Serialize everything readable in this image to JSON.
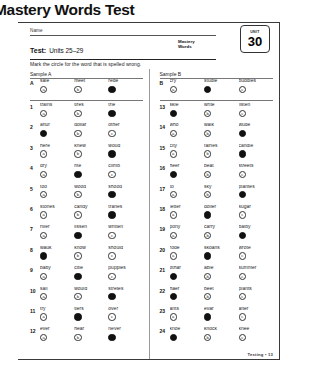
{
  "page_title": "Mastery Words Test",
  "header": {
    "name_label": "Name",
    "test_label": "Test:",
    "test_units": "Units 25–29",
    "mastery_line1": "Mastery",
    "mastery_line2": "Words",
    "unit_word": "UNIT",
    "unit_number": "30"
  },
  "instructions": "Mark the circle for the word that is spelled wrong.",
  "footer": "Testing • 13",
  "left_column": {
    "sample_label": "Sample A",
    "sample": {
      "num": "A",
      "choices": [
        {
          "word": "sale",
          "letter": "a",
          "filled": false
        },
        {
          "word": "meet",
          "letter": "b",
          "filled": false
        },
        {
          "word": "rede",
          "letter": "c",
          "filled": true
        }
      ]
    },
    "items": [
      {
        "num": "1",
        "choices": [
          {
            "word": "trains",
            "letter": "a",
            "filled": false
          },
          {
            "word": "tires",
            "letter": "b",
            "filled": false
          },
          {
            "word": "trie",
            "letter": "c",
            "filled": true
          }
        ]
      },
      {
        "num": "2",
        "choices": [
          {
            "word": "aftur",
            "letter": "a",
            "filled": true
          },
          {
            "word": "dollar",
            "letter": "b",
            "filled": false
          },
          {
            "word": "other",
            "letter": "c",
            "filled": false
          }
        ]
      },
      {
        "num": "3",
        "choices": [
          {
            "word": "here",
            "letter": "a",
            "filled": false
          },
          {
            "word": "knew",
            "letter": "b",
            "filled": false
          },
          {
            "word": "woud",
            "letter": "c",
            "filled": true
          }
        ]
      },
      {
        "num": "4",
        "choices": [
          {
            "word": "dry",
            "letter": "a",
            "filled": false
          },
          {
            "word": "rite",
            "letter": "b",
            "filled": true
          },
          {
            "word": "climb",
            "letter": "c",
            "filled": false
          }
        ]
      },
      {
        "num": "5",
        "choices": [
          {
            "word": "too",
            "letter": "a",
            "filled": false
          },
          {
            "word": "wood",
            "letter": "b",
            "filled": false
          },
          {
            "word": "shood",
            "letter": "c",
            "filled": true
          }
        ]
      },
      {
        "num": "6",
        "choices": [
          {
            "word": "stones",
            "letter": "a",
            "filled": false
          },
          {
            "word": "candy",
            "letter": "b",
            "filled": false
          },
          {
            "word": "tranes",
            "letter": "c",
            "filled": true
          }
        ]
      },
      {
        "num": "7",
        "choices": [
          {
            "word": "river",
            "letter": "a",
            "filled": false
          },
          {
            "word": "lissen",
            "letter": "b",
            "filled": true
          },
          {
            "word": "written",
            "letter": "c",
            "filled": false
          }
        ]
      },
      {
        "num": "8",
        "choices": [
          {
            "word": "wauk",
            "letter": "a",
            "filled": true
          },
          {
            "word": "know",
            "letter": "b",
            "filled": false
          },
          {
            "word": "should",
            "letter": "c",
            "filled": false
          }
        ]
      },
      {
        "num": "9",
        "choices": [
          {
            "word": "baby",
            "letter": "a",
            "filled": false
          },
          {
            "word": "citie",
            "letter": "b",
            "filled": true
          },
          {
            "word": "puppies",
            "letter": "c",
            "filled": false
          }
        ]
      },
      {
        "num": "10",
        "choices": [
          {
            "word": "sail",
            "letter": "a",
            "filled": false
          },
          {
            "word": "would",
            "letter": "b",
            "filled": false
          },
          {
            "word": "stretes",
            "letter": "c",
            "filled": true
          }
        ]
      },
      {
        "num": "11",
        "choices": [
          {
            "word": "try",
            "letter": "a",
            "filled": false
          },
          {
            "word": "tiers",
            "letter": "b",
            "filled": true
          },
          {
            "word": "over",
            "letter": "c",
            "filled": false
          }
        ]
      },
      {
        "num": "12",
        "choices": [
          {
            "word": "ever",
            "letter": "a",
            "filled": false
          },
          {
            "word": "hear",
            "letter": "b",
            "filled": false
          },
          {
            "word": "never",
            "letter": "c",
            "filled": true
          }
        ]
      }
    ]
  },
  "right_column": {
    "sample_label": "Sample B",
    "sample": {
      "num": "B",
      "choices": [
        {
          "word": "cry",
          "letter": "a",
          "filled": false
        },
        {
          "word": "studie",
          "letter": "b",
          "filled": true
        },
        {
          "word": "buddies",
          "letter": "c",
          "filled": false
        }
      ]
    },
    "items": [
      {
        "num": "13",
        "choices": [
          {
            "word": "skie",
            "letter": "a",
            "filled": true
          },
          {
            "word": "write",
            "letter": "b",
            "filled": false
          },
          {
            "word": "listen",
            "letter": "c",
            "filled": false
          }
        ]
      },
      {
        "num": "14",
        "choices": [
          {
            "word": "who",
            "letter": "a",
            "filled": false
          },
          {
            "word": "walk",
            "letter": "b",
            "filled": false
          },
          {
            "word": "wude",
            "letter": "c",
            "filled": true
          }
        ]
      },
      {
        "num": "15",
        "choices": [
          {
            "word": "city",
            "letter": "a",
            "filled": false
          },
          {
            "word": "fairies",
            "letter": "b",
            "filled": false
          },
          {
            "word": "candie",
            "letter": "c",
            "filled": true
          }
        ]
      },
      {
        "num": "16",
        "choices": [
          {
            "word": "heer",
            "letter": "a",
            "filled": true
          },
          {
            "word": "beat",
            "letter": "b",
            "filled": false
          },
          {
            "word": "streets",
            "letter": "c",
            "filled": false
          }
        ]
      },
      {
        "num": "17",
        "choices": [
          {
            "word": "to",
            "letter": "a",
            "filled": false
          },
          {
            "word": "sky",
            "letter": "b",
            "filled": false
          },
          {
            "word": "plantes",
            "letter": "c",
            "filled": true
          }
        ]
      },
      {
        "num": "18",
        "choices": [
          {
            "word": "letter",
            "letter": "a",
            "filled": false
          },
          {
            "word": "doller",
            "letter": "b",
            "filled": true
          },
          {
            "word": "sugar",
            "letter": "c",
            "filled": false
          }
        ]
      },
      {
        "num": "19",
        "choices": [
          {
            "word": "pony",
            "letter": "a",
            "filled": false
          },
          {
            "word": "carry",
            "letter": "b",
            "filled": false
          },
          {
            "word": "baiby",
            "letter": "c",
            "filled": true
          }
        ]
      },
      {
        "num": "20",
        "choices": [
          {
            "word": "rode",
            "letter": "a",
            "filled": false
          },
          {
            "word": "skoans",
            "letter": "b",
            "filled": true
          },
          {
            "word": "wrote",
            "letter": "c",
            "filled": false
          }
        ]
      },
      {
        "num": "21",
        "choices": [
          {
            "word": "othar",
            "letter": "a",
            "filled": true
          },
          {
            "word": "able",
            "letter": "b",
            "filled": false
          },
          {
            "word": "summer",
            "letter": "c",
            "filled": false
          }
        ]
      },
      {
        "num": "22",
        "choices": [
          {
            "word": "haer",
            "letter": "a",
            "filled": true
          },
          {
            "word": "beet",
            "letter": "b",
            "filled": false
          },
          {
            "word": "plants",
            "letter": "c",
            "filled": false
          }
        ]
      },
      {
        "num": "23",
        "choices": [
          {
            "word": "ants",
            "letter": "a",
            "filled": false
          },
          {
            "word": "evar",
            "letter": "b",
            "filled": true
          },
          {
            "word": "after",
            "letter": "c",
            "filled": false
          }
        ]
      },
      {
        "num": "24",
        "choices": [
          {
            "word": "knoe",
            "letter": "a",
            "filled": true
          },
          {
            "word": "knock",
            "letter": "b",
            "filled": false
          },
          {
            "word": "knee",
            "letter": "c",
            "filled": false
          }
        ]
      }
    ]
  }
}
